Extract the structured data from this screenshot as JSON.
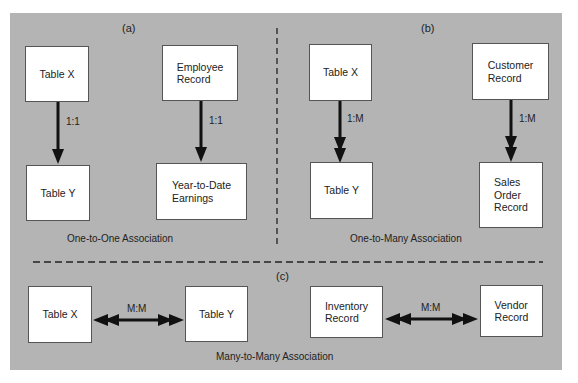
{
  "panels": {
    "a": {
      "letter": "(a)",
      "caption": "One-to-One Association",
      "boxes": [
        "Table X",
        "Table Y",
        "Employee\nRecord",
        "Year-to-Date\nEarnings"
      ],
      "relations": [
        "1:1",
        "1:1"
      ]
    },
    "b": {
      "letter": "(b)",
      "caption": "One-to-Many Association",
      "boxes": [
        "Table X",
        "Table Y",
        "Customer\nRecord",
        "Sales\nOrder\nRecord"
      ],
      "relations": [
        "1:M",
        "1:M"
      ]
    },
    "c": {
      "letter": "(c)",
      "caption": "Many-to-Many Association",
      "boxes": [
        "Table X",
        "Table Y",
        "Inventory\nRecord",
        "Vendor\nRecord"
      ],
      "relations": [
        "M:M",
        "M:M"
      ]
    }
  },
  "colors": {
    "background": "#b4b4b4",
    "box": "#ffffff",
    "arrow": "#111111"
  }
}
